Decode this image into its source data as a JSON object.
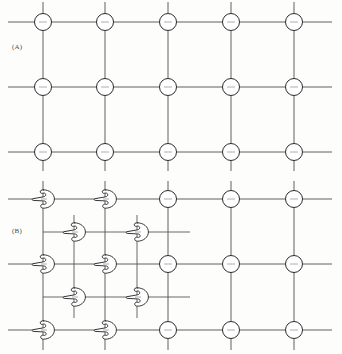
{
  "figure": {
    "background_color": "#fdfdfb",
    "line_color": "#4f4f52",
    "node_stroke_color": "#2c2c2e",
    "node_fill_color": "#ffffff",
    "line_width": 0.9,
    "width": 342,
    "height": 354
  },
  "panels": [
    {
      "id": "panel-a",
      "label": "(A)",
      "label_x": 12,
      "label_y": 43,
      "description": "Plain rectangular lattice; every intersection carries an open circle node with crosshair lines passing through it.",
      "node_glyph": "circle",
      "columns_x": [
        43,
        105,
        168,
        231,
        294
      ],
      "rows_y": [
        22,
        87,
        152
      ],
      "h_line_start_x": 8,
      "h_line_end_x": 332,
      "v_line_start_y": 2,
      "v_line_end_y": 171,
      "node_radius": 8.5
    },
    {
      "id": "panel-b",
      "label": "(B)",
      "label_x": 12,
      "label_y": 227,
      "description": "Same rectangular lattice, but the two left-hand columns carry a chiral comma motif instead of a circle; an interleaved finer sub-lattice of comma motifs fills the left region.",
      "node_glyph_primary": "comma",
      "node_glyph_secondary": "circle",
      "columns_x": [
        43,
        105,
        168,
        231,
        294
      ],
      "rows_y": [
        199,
        264,
        330
      ],
      "sub_columns_x": [
        74,
        137
      ],
      "sub_rows_y": [
        232,
        297
      ],
      "comma_columns_x": [
        43,
        105
      ],
      "circle_columns_x": [
        168,
        231,
        294
      ],
      "h_line_start_x": 8,
      "h_line_end_x": 332,
      "v_line_start_y": 181,
      "v_line_end_y": 350,
      "sub_h_line_start_x": 43,
      "sub_h_line_end_x": 190,
      "sub_v_line_start_y": 215,
      "sub_v_line_end_y": 318,
      "node_radius": 8.5
    }
  ],
  "legend": {
    "circle_meaning": "lattice point (achiral site)",
    "comma_meaning": "chiral motif (comma) marking handedness of the site"
  }
}
